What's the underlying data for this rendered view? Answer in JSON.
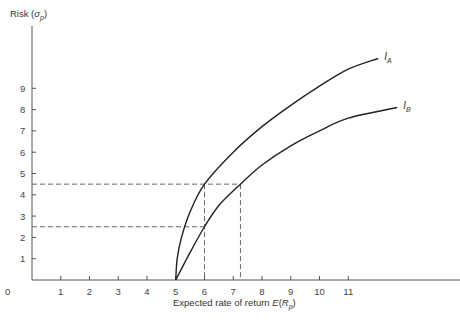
{
  "chart_data": {
    "type": "line",
    "title": "",
    "xlabel": "Expected rate of return E(R_p)",
    "ylabel": "Risk (σ_p)",
    "xlim": [
      0,
      12.5
    ],
    "ylim": [
      0,
      11
    ],
    "grid": false,
    "x_ticks": [
      "0",
      "1",
      "2",
      "3",
      "4",
      "5",
      "6",
      "7",
      "8",
      "9",
      "10",
      "11"
    ],
    "y_ticks": [
      "1",
      "2",
      "3",
      "4",
      "5",
      "6",
      "7",
      "8",
      "9"
    ],
    "series": [
      {
        "name": "I_A",
        "label": "I",
        "subscript": "A",
        "x": [
          5,
          5.05,
          5.2,
          5.5,
          6,
          7,
          8,
          9,
          10,
          11,
          12.04
        ],
        "y": [
          0,
          1.0,
          2.0,
          3.2,
          4.5,
          6.0,
          7.2,
          8.2,
          9.1,
          9.9,
          10.4
        ]
      },
      {
        "name": "I_B",
        "label": "I",
        "subscript": "B",
        "x": [
          5,
          5.5,
          6,
          6.5,
          7.25,
          8,
          9,
          10,
          11,
          12.7
        ],
        "y": [
          0,
          1.3,
          2.5,
          3.5,
          4.5,
          5.4,
          6.3,
          7.0,
          7.6,
          8.1
        ]
      }
    ],
    "annotations": [
      {
        "type": "hline-dashed",
        "y": 4.5,
        "x_to": 7.25
      },
      {
        "type": "hline-dashed",
        "y": 2.5,
        "x_to": 6
      },
      {
        "type": "vline-dashed",
        "x": 6,
        "y_to": 4.5
      },
      {
        "type": "vline-dashed",
        "x": 7.25,
        "y_to": 4.5
      }
    ]
  },
  "axes": {
    "y_title_main": "Risk (",
    "y_title_sym": "σ",
    "y_title_sub": "p",
    "y_title_close": ")",
    "x_title_main": "Expected rate of return ",
    "x_title_fn": "E",
    "x_title_paren": "(",
    "x_title_sym": "R",
    "x_title_sub": "p",
    "x_title_close": ")",
    "origin_label": "0"
  }
}
